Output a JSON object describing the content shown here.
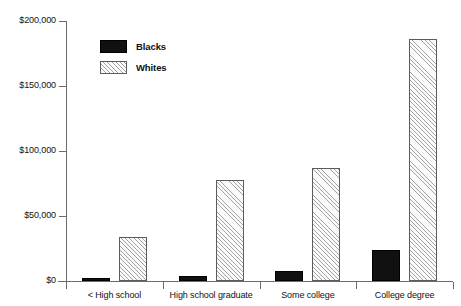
{
  "chart_data": {
    "type": "bar",
    "title": "",
    "subtitle": "",
    "xlabel": "",
    "ylabel": "",
    "categories": [
      "< High school",
      "High school graduate",
      "Some college",
      "College degree"
    ],
    "series": [
      {
        "name": "Blacks",
        "color": "#111111",
        "fill": "solid",
        "values": [
          2000,
          4000,
          8000,
          24000
        ]
      },
      {
        "name": "Whites",
        "color": "#fbfbfb",
        "fill": "diagonal-hatch",
        "values": [
          34000,
          78000,
          87000,
          186000
        ]
      }
    ],
    "ylim": [
      0,
      200000
    ],
    "yticks": [
      0,
      50000,
      100000,
      150000,
      200000
    ],
    "ytick_labels": [
      "$0",
      "$50,000",
      "$100,000",
      "$150,000",
      "$200,000"
    ],
    "grid": false,
    "legend_position": "top-left-inside",
    "axis_color": "#6b6b6b"
  },
  "legend": {
    "entries": [
      {
        "label": "Blacks"
      },
      {
        "label": "Whites"
      }
    ]
  }
}
